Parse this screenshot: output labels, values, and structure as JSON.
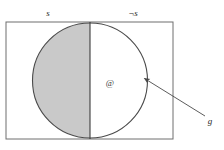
{
  "figure": {
    "type": "logic-diagram",
    "labels": {
      "left_region": "s",
      "right_region": "¬s",
      "arrow_target": "g",
      "world_marker": "@"
    },
    "colors": {
      "shading": "#c9c9c9",
      "stroke": "#4a4a4a",
      "rect_stroke": "#6e6e6e",
      "background": "#ffffff",
      "text": "#2b2b2b"
    },
    "geometry": {
      "rect": {
        "x": 6,
        "y": 22,
        "width": 167,
        "height": 117
      },
      "divider_x": 90,
      "circle": {
        "cx": 90,
        "cy": 80.5,
        "r": 57.5
      },
      "arrow": {
        "from_x": 205,
        "from_y": 116,
        "to_x": 143,
        "to_y": 78
      },
      "label_positions": {
        "left_region": {
          "x": 48,
          "y": 16
        },
        "right_region": {
          "x": 129,
          "y": 16
        },
        "arrow_target": {
          "x": 210,
          "y": 124
        },
        "world_marker": {
          "x": 110,
          "y": 86
        }
      }
    }
  }
}
